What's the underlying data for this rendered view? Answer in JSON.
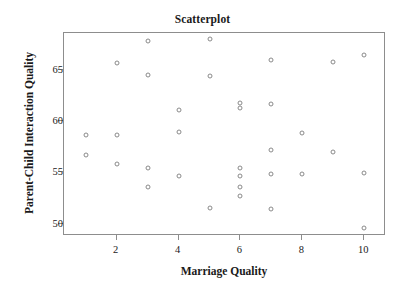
{
  "chart_data": {
    "type": "scatter",
    "title": "Scatterplot",
    "xlabel": "Marriage Quality",
    "ylabel": "Parent-Child Interaction Quality",
    "xlim": [
      0.3,
      10.7
    ],
    "ylim": [
      48.8,
      68.6
    ],
    "grid": false,
    "legend": null,
    "xticks": [
      2,
      4,
      6,
      8,
      10
    ],
    "xtick_labels": [
      "2",
      "4",
      "6",
      "8",
      "10"
    ],
    "yticks": [
      50,
      55,
      60,
      65
    ],
    "ytick_labels": [
      "50",
      "55",
      "60",
      "65"
    ],
    "marker": {
      "shape": "open-circle",
      "edge_color": "#8a8a8a",
      "fill_color": "#ffffff",
      "size_px": 5
    },
    "frame_color": "#8d8d8d",
    "background_color": "#ffffff",
    "n_points": 30,
    "x": [
      1,
      1,
      2,
      2,
      2,
      3,
      3,
      3,
      3,
      4,
      4,
      4,
      5,
      5,
      5,
      6,
      6,
      6,
      6,
      6,
      6,
      7,
      7,
      7,
      7,
      7,
      8,
      8,
      9,
      9,
      10,
      10,
      10
    ],
    "y": [
      58.7,
      56.7,
      65.7,
      58.7,
      55.8,
      67.8,
      64.5,
      55.4,
      53.6,
      61.1,
      58.9,
      54.7,
      68.0,
      64.4,
      51.5,
      61.8,
      61.3,
      55.4,
      54.7,
      53.6,
      52.7,
      66.0,
      61.7,
      57.2,
      54.8,
      51.4,
      58.8,
      54.8,
      65.8,
      57.0,
      66.5,
      54.9,
      49.6
    ],
    "points": [
      {
        "x": 1,
        "y": 58.7
      },
      {
        "x": 1,
        "y": 56.7
      },
      {
        "x": 2,
        "y": 65.7
      },
      {
        "x": 2,
        "y": 58.7
      },
      {
        "x": 2,
        "y": 55.8
      },
      {
        "x": 3,
        "y": 67.8
      },
      {
        "x": 3,
        "y": 64.5
      },
      {
        "x": 3,
        "y": 55.4
      },
      {
        "x": 3,
        "y": 53.6
      },
      {
        "x": 4,
        "y": 61.1
      },
      {
        "x": 4,
        "y": 58.9
      },
      {
        "x": 4,
        "y": 54.7
      },
      {
        "x": 5,
        "y": 68.0
      },
      {
        "x": 5,
        "y": 64.4
      },
      {
        "x": 5,
        "y": 51.5
      },
      {
        "x": 6,
        "y": 61.8
      },
      {
        "x": 6,
        "y": 61.3
      },
      {
        "x": 6,
        "y": 55.4
      },
      {
        "x": 6,
        "y": 54.7
      },
      {
        "x": 6,
        "y": 53.6
      },
      {
        "x": 6,
        "y": 52.7
      },
      {
        "x": 7,
        "y": 66.0
      },
      {
        "x": 7,
        "y": 61.7
      },
      {
        "x": 7,
        "y": 57.2
      },
      {
        "x": 7,
        "y": 54.8
      },
      {
        "x": 7,
        "y": 51.4
      },
      {
        "x": 8,
        "y": 58.8
      },
      {
        "x": 8,
        "y": 54.8
      },
      {
        "x": 9,
        "y": 65.8
      },
      {
        "x": 9,
        "y": 57.0
      },
      {
        "x": 10,
        "y": 66.5
      },
      {
        "x": 10,
        "y": 54.9
      },
      {
        "x": 10,
        "y": 49.6
      }
    ]
  }
}
